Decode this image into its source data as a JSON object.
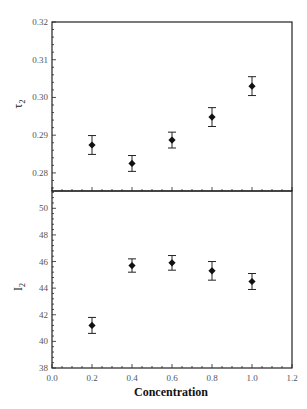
{
  "chart_data": [
    {
      "type": "scatter",
      "panel": "top",
      "title": "",
      "xlabel": "Concentration",
      "ylabel": "τ2",
      "x": [
        0.2,
        0.4,
        0.6,
        0.8,
        1.0
      ],
      "series": [
        {
          "name": "τ2",
          "values": [
            0.2874,
            0.2825,
            0.2887,
            0.2948,
            0.303
          ],
          "error": [
            0.0025,
            0.0021,
            0.0021,
            0.0025,
            0.0025
          ]
        }
      ],
      "xlim": [
        0.0,
        1.2
      ],
      "ylim": [
        0.2752,
        0.32
      ],
      "yticks": [
        "0.28",
        "0.29",
        "0.30",
        "0.31",
        "0.32"
      ],
      "grid": false,
      "legend": null,
      "marker": "diamond"
    },
    {
      "type": "scatter",
      "panel": "bottom",
      "title": "",
      "xlabel": "Concentration",
      "ylabel": "I2",
      "x": [
        0.2,
        0.4,
        0.6,
        0.8,
        1.0
      ],
      "series": [
        {
          "name": "I2",
          "values": [
            41.2,
            45.7,
            45.9,
            45.3,
            44.5
          ],
          "error": [
            0.6,
            0.5,
            0.55,
            0.7,
            0.6
          ]
        }
      ],
      "xlim": [
        0.0,
        1.2
      ],
      "ylim": [
        38,
        51.3
      ],
      "xticks": [
        "0.0",
        "0.2",
        "0.4",
        "0.6",
        "0.8",
        "1.0",
        "1.2"
      ],
      "yticks": [
        "38",
        "40",
        "42",
        "44",
        "46",
        "48",
        "50"
      ],
      "grid": false,
      "legend": null,
      "marker": "diamond"
    }
  ],
  "labels": {
    "xlabel": "Concentration",
    "top_ylabel_main": "τ",
    "top_ylabel_sub": "2",
    "bottom_ylabel_main": "I",
    "bottom_ylabel_sub": "2"
  },
  "style": {
    "axis_color": "#222222",
    "marker_color": "#111111",
    "tick_label_color": "#555555"
  }
}
